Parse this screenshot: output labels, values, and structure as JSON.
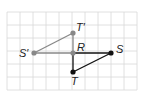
{
  "diagram": {
    "type": "geometry-reflection-grid",
    "grid": {
      "x0": 7,
      "y0": 12,
      "cols": 10,
      "rows": 6,
      "cell": 13,
      "color": "#d8d8d8"
    },
    "points": [
      {
        "id": "S_prime",
        "label": "S′",
        "x": 34,
        "y": 53,
        "color": "#888888",
        "lx": 19,
        "ly": 57
      },
      {
        "id": "T_prime",
        "label": "T′",
        "x": 73,
        "y": 33,
        "color": "#888888",
        "lx": 76,
        "ly": 31
      },
      {
        "id": "R",
        "label": "R",
        "x": 73,
        "y": 53,
        "color": "#888888",
        "lx": 77,
        "ly": 51
      },
      {
        "id": "S",
        "label": "S",
        "x": 111,
        "y": 53,
        "color": "#111111",
        "lx": 116,
        "ly": 53
      },
      {
        "id": "T",
        "label": "T",
        "x": 73,
        "y": 72,
        "color": "#111111",
        "lx": 71,
        "ly": 85
      }
    ],
    "segments": [
      {
        "from": "S_prime",
        "to": "T_prime",
        "color": "#888888"
      },
      {
        "from": "T_prime",
        "to": "R",
        "color": "#888888"
      },
      {
        "from": "S_prime",
        "to": "R",
        "color": "#888888"
      },
      {
        "from": "R",
        "to": "S",
        "color": "#111111"
      },
      {
        "from": "R",
        "to": "T",
        "color": "#111111"
      },
      {
        "from": "T",
        "to": "S",
        "color": "#111111"
      }
    ]
  }
}
